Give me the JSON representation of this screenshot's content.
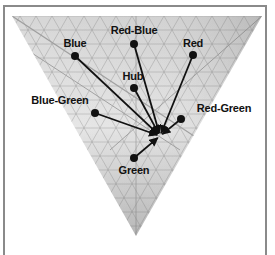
{
  "diagram": {
    "type": "color-triangle-arrows",
    "target": {
      "x": 160,
      "y": 136
    },
    "nodes": [
      {
        "id": "blue",
        "label": "Blue",
        "dot": [
          75,
          56
        ],
        "label_pos": [
          75,
          43
        ]
      },
      {
        "id": "red-blue",
        "label": "Red-Blue",
        "dot": [
          134,
          44
        ],
        "label_pos": [
          134,
          30
        ]
      },
      {
        "id": "red",
        "label": "Red",
        "dot": [
          193,
          55
        ],
        "label_pos": [
          193,
          43
        ]
      },
      {
        "id": "hub",
        "label": "Hub",
        "dot": [
          134,
          88
        ],
        "label_pos": [
          133,
          76
        ]
      },
      {
        "id": "blue-green",
        "label": "Blue-Green",
        "dot": [
          95,
          113
        ],
        "label_pos": [
          60,
          100
        ]
      },
      {
        "id": "red-green",
        "label": "Red-Green",
        "dot": [
          181,
          119
        ],
        "label_pos": [
          224,
          108
        ]
      },
      {
        "id": "green",
        "label": "Green",
        "dot": [
          134,
          158
        ],
        "label_pos": [
          134,
          170
        ]
      }
    ],
    "colors": {
      "frame": "#8a8a8a",
      "arrow": "#111111",
      "grid": "#6f6f6f"
    }
  }
}
